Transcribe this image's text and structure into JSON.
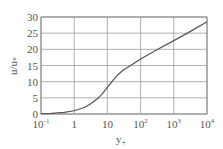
{
  "chart_data": {
    "type": "line",
    "title": "",
    "xlabel": "y+",
    "ylabel": "u/u*",
    "xscale": "log",
    "xlim": [
      0.1,
      10000
    ],
    "ylim": [
      0,
      30
    ],
    "grid": true,
    "legend": null,
    "x_tick_labels": [
      "10-1",
      "1",
      "10",
      "102",
      "103",
      "104"
    ],
    "y_tick_labels": [
      "0",
      "5",
      "10",
      "15",
      "20",
      "25",
      "30"
    ],
    "series": [
      {
        "name": "velocity profile",
        "x": [
          0.1,
          0.2,
          0.5,
          1,
          2,
          3,
          5,
          7,
          10,
          15,
          20,
          30,
          50,
          100,
          300,
          1000,
          3000,
          10000
        ],
        "values": [
          0.1,
          0.2,
          0.5,
          1.0,
          2.0,
          3.0,
          4.7,
          6.2,
          8.2,
          10.5,
          12.0,
          13.6,
          15.0,
          17.0,
          19.8,
          22.7,
          25.4,
          28.5
        ]
      }
    ]
  },
  "axes": {
    "x_label_main": "y",
    "x_label_sub": "+",
    "y_label": "u/u",
    "y_label_sub": "*"
  },
  "ticks": {
    "x": [
      {
        "base": "10",
        "exp": "-1"
      },
      {
        "base": "1",
        "exp": ""
      },
      {
        "base": "10",
        "exp": ""
      },
      {
        "base": "10",
        "exp": "2"
      },
      {
        "base": "10",
        "exp": "3"
      },
      {
        "base": "10",
        "exp": "4"
      }
    ],
    "y": [
      "0",
      "5",
      "10",
      "15",
      "20",
      "25",
      "30"
    ]
  },
  "colors": {
    "grid": "#9a9a9a",
    "axis": "#777777",
    "curve": "#555555",
    "text": "#555555"
  }
}
